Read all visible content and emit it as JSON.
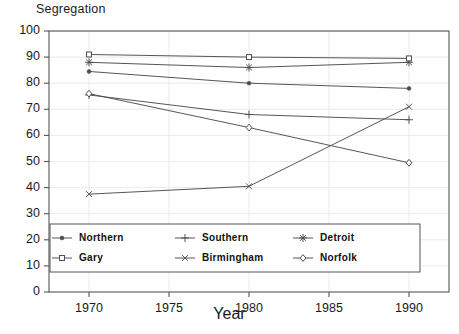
{
  "chart_data": {
    "type": "line",
    "title": "Segregation",
    "xlabel": "Year",
    "ylabel": "",
    "x": [
      1970,
      1980,
      1990
    ],
    "xlim": [
      1967.5,
      1992.5
    ],
    "ylim": [
      0,
      100
    ],
    "xticks": [
      "1970",
      "1975",
      "1980",
      "1985",
      "1990"
    ],
    "xtickvalues": [
      1970,
      1975,
      1980,
      1985,
      1990
    ],
    "yticks": [
      "0",
      "10",
      "20",
      "30",
      "40",
      "50",
      "60",
      "70",
      "80",
      "90",
      "100"
    ],
    "ytickvalues": [
      0,
      10,
      20,
      30,
      40,
      50,
      60,
      70,
      80,
      90,
      100
    ],
    "grid": true,
    "legend_position": "bottom-inside",
    "series": [
      {
        "name": "Northern",
        "marker": "filled-dot",
        "values": [
          84.5,
          80.0,
          78.0
        ]
      },
      {
        "name": "Southern",
        "marker": "plus",
        "values": [
          75.5,
          68.0,
          66.0
        ]
      },
      {
        "name": "Detroit",
        "marker": "asterisk",
        "values": [
          88.0,
          86.0,
          88.0
        ]
      },
      {
        "name": "Gary",
        "marker": "square",
        "values": [
          91.0,
          90.0,
          89.5
        ]
      },
      {
        "name": "Birmingham",
        "marker": "cross",
        "values": [
          37.5,
          40.5,
          71.0
        ]
      },
      {
        "name": "Norfolk",
        "marker": "diamond",
        "values": [
          76.0,
          63.0,
          49.5
        ]
      }
    ]
  },
  "legend": {
    "items": [
      {
        "label": "Northern",
        "marker": "filled-dot"
      },
      {
        "label": "Southern",
        "marker": "plus"
      },
      {
        "label": "Detroit",
        "marker": "asterisk"
      },
      {
        "label": "Gary",
        "marker": "square"
      },
      {
        "label": "Birmingham",
        "marker": "cross"
      },
      {
        "label": "Norfolk",
        "marker": "diamond"
      }
    ]
  },
  "colors": {
    "line": "#4d4d4d",
    "axis": "#555555",
    "grid": "#e8e8ee",
    "text": "#1a1a1a",
    "background": "#ffffff"
  }
}
